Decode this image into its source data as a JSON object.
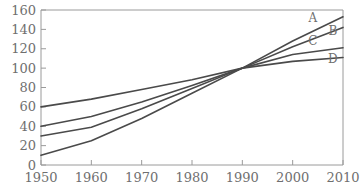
{
  "chart_data": {
    "type": "line",
    "title": "",
    "subtitle": "",
    "xlabel": "",
    "ylabel": "",
    "x": [
      1950,
      1960,
      1970,
      1980,
      1990,
      2000,
      2010
    ],
    "xlim": [
      1950,
      2010
    ],
    "ylim": [
      0,
      160
    ],
    "xticks": [
      "1950",
      "1960",
      "1970",
      "1980",
      "1990",
      "2000",
      "2010"
    ],
    "yticks": [
      "0",
      "20",
      "40",
      "60",
      "80",
      "100",
      "120",
      "140",
      "160"
    ],
    "grid": false,
    "legend_position": "line-end-labels",
    "line_color": "#4a4a4a",
    "axis_color": "#9a9a9a",
    "series": [
      {
        "name": "A",
        "label": "A",
        "values": [
          60,
          68,
          78,
          88,
          100,
          128,
          153
        ]
      },
      {
        "name": "B",
        "label": "B",
        "values": [
          40,
          50,
          65,
          82,
          100,
          122,
          142
        ]
      },
      {
        "name": "C",
        "label": "C",
        "values": [
          30,
          39,
          58,
          79,
          100,
          114,
          121
        ]
      },
      {
        "name": "D",
        "label": "D",
        "values": [
          10,
          25,
          48,
          74,
          100,
          107,
          111
        ]
      }
    ],
    "annotations": [
      {
        "text": "A",
        "x": 2004,
        "y": 148
      },
      {
        "text": "B",
        "x": 2008,
        "y": 134
      },
      {
        "text": "C",
        "x": 2004,
        "y": 124
      },
      {
        "text": "D",
        "x": 2008,
        "y": 105
      }
    ]
  }
}
